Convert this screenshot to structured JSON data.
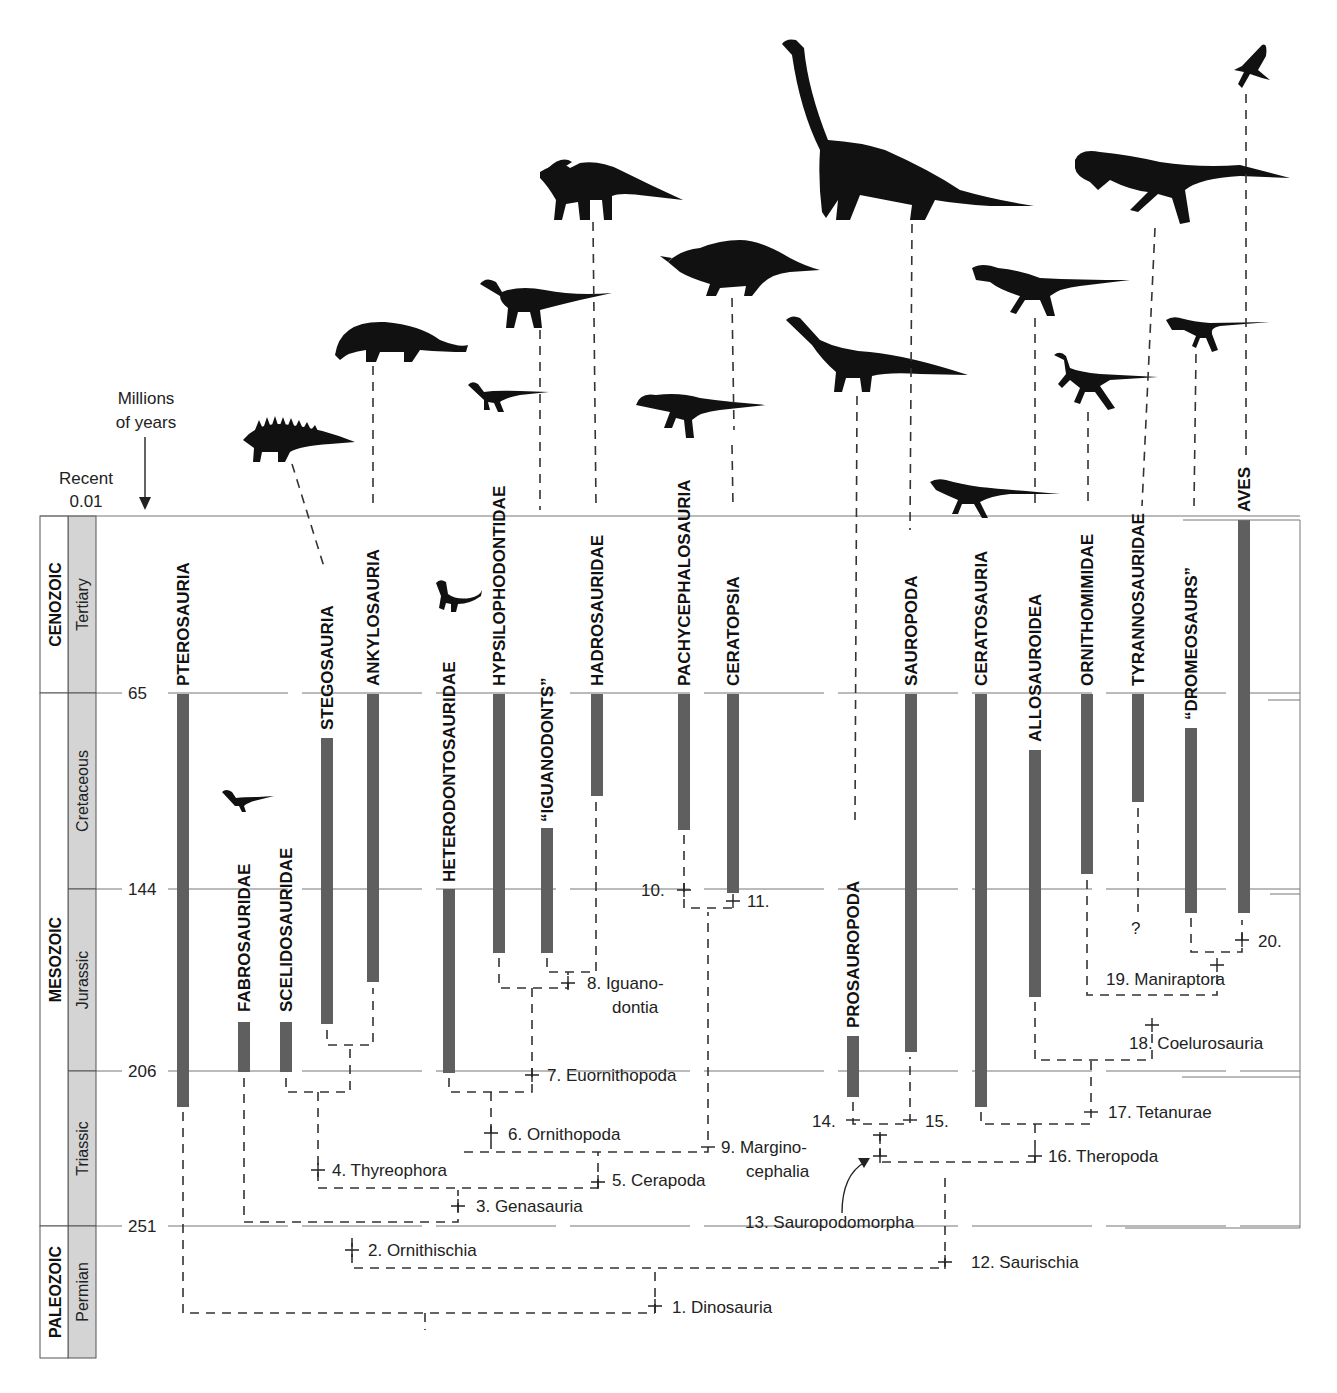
{
  "axis": {
    "title_line1": "Millions",
    "title_line2": "of years",
    "recent_label": "Recent",
    "recent_value": "0.01",
    "ticks": [
      {
        "label": "65",
        "y": 693
      },
      {
        "label": "144",
        "y": 889
      },
      {
        "label": "206",
        "y": 1071
      },
      {
        "label": "251",
        "y": 1226
      }
    ]
  },
  "timescale": {
    "eras": [
      {
        "name": "CENOZOIC",
        "y0": 516,
        "y1": 693
      },
      {
        "name": "MESOZOIC",
        "y0": 693,
        "y1": 1226
      },
      {
        "name": "PALEOZOIC",
        "y0": 1226,
        "y1": 1358
      }
    ],
    "periods": [
      {
        "name": "Tertiary",
        "y0": 516,
        "y1": 693
      },
      {
        "name": "Cretaceous",
        "y0": 693,
        "y1": 889
      },
      {
        "name": "Jurassic",
        "y0": 889,
        "y1": 1071
      },
      {
        "name": "Triassic",
        "y0": 1071,
        "y1": 1226
      },
      {
        "name": "Permian",
        "y0": 1226,
        "y1": 1358
      }
    ]
  },
  "taxa": [
    {
      "name": "PTEROSAURIA",
      "x": 183,
      "label_bottom": 686,
      "bar_top": 694,
      "bar_bottom": 1107
    },
    {
      "name": "FABROSAURIDAE",
      "x": 244,
      "label_bottom": 1012,
      "bar_top": 1022,
      "bar_bottom": 1072
    },
    {
      "name": "SCELIDOSAURIDAE",
      "x": 286,
      "label_bottom": 1012,
      "bar_top": 1022,
      "bar_bottom": 1072
    },
    {
      "name": "STEGOSAURIA",
      "x": 327,
      "label_bottom": 730,
      "bar_top": 738,
      "bar_bottom": 1024
    },
    {
      "name": "ANKYLOSAURIA",
      "x": 373,
      "label_bottom": 686,
      "bar_top": 694,
      "bar_bottom": 982
    },
    {
      "name": "HETERODONTOSAURIDAE",
      "x": 449,
      "label_bottom": 882,
      "bar_top": 889,
      "bar_bottom": 1073
    },
    {
      "name": "HYPSILOPHODONTIDAE",
      "x": 499,
      "label_bottom": 686,
      "bar_top": 694,
      "bar_bottom": 953
    },
    {
      "name": "“IGUANODONTS”",
      "x": 547,
      "label_bottom": 822,
      "bar_top": 828,
      "bar_bottom": 953
    },
    {
      "name": "HADROSAURIDAE",
      "x": 597,
      "label_bottom": 686,
      "bar_top": 694,
      "bar_bottom": 796
    },
    {
      "name": "PACHYCEPHALOSAURIA",
      "x": 684,
      "label_bottom": 686,
      "bar_top": 694,
      "bar_bottom": 830
    },
    {
      "name": "CERATOPSIA",
      "x": 733,
      "label_bottom": 686,
      "bar_top": 694,
      "bar_bottom": 893
    },
    {
      "name": "PROSAUROPODA",
      "x": 853,
      "label_bottom": 1028,
      "bar_top": 1036,
      "bar_bottom": 1097
    },
    {
      "name": "SAUROPODA",
      "x": 911,
      "label_bottom": 686,
      "bar_top": 694,
      "bar_bottom": 1052
    },
    {
      "name": "CERATOSAURIA",
      "x": 981,
      "label_bottom": 686,
      "bar_top": 694,
      "bar_bottom": 1107
    },
    {
      "name": "ALLOSAUROIDEA",
      "x": 1035,
      "label_bottom": 742,
      "bar_top": 750,
      "bar_bottom": 997
    },
    {
      "name": "ORNITHOMIMIDAE",
      "x": 1087,
      "label_bottom": 686,
      "bar_top": 694,
      "bar_bottom": 874
    },
    {
      "name": "TYRANNOSAURIDAE",
      "x": 1138,
      "label_bottom": 686,
      "bar_top": 694,
      "bar_bottom": 802
    },
    {
      "name": "“DROMEOSAURS”",
      "x": 1191,
      "label_bottom": 720,
      "bar_top": 728,
      "bar_bottom": 913
    },
    {
      "name": "AVES",
      "x": 1244,
      "label_bottom": 512,
      "bar_top": 520,
      "bar_bottom": 913
    }
  ],
  "nodes": [
    {
      "label": "1. Dinosauria",
      "x": 672,
      "y": 1313
    },
    {
      "label": "2. Ornithischia",
      "x": 368,
      "y": 1256
    },
    {
      "label": "3. Genasauria",
      "x": 476,
      "y": 1212
    },
    {
      "label": "4. Thyreophora",
      "x": 332,
      "y": 1176
    },
    {
      "label": "5. Cerapoda",
      "x": 612,
      "y": 1186
    },
    {
      "label": "6. Ornithopoda",
      "x": 508,
      "y": 1140
    },
    {
      "label": "7. Euornithopoda",
      "x": 547,
      "y": 1081
    },
    {
      "label": "8. Iguano-",
      "x": 587,
      "y": 989
    },
    {
      "label": "dontia",
      "x": 612,
      "y": 1013
    },
    {
      "label": "9. Margino-",
      "x": 721,
      "y": 1153
    },
    {
      "label": "cephalia",
      "x": 746,
      "y": 1177
    },
    {
      "label": "10.",
      "x": 641,
      "y": 896
    },
    {
      "label": "11.",
      "x": 747,
      "y": 907
    },
    {
      "label": "12. Saurischia",
      "x": 971,
      "y": 1268
    },
    {
      "label": "13. Sauropodomorpha",
      "x": 745,
      "y": 1228
    },
    {
      "label": "14.",
      "x": 812,
      "y": 1127
    },
    {
      "label": "15.",
      "x": 925,
      "y": 1127
    },
    {
      "label": "16. Theropoda",
      "x": 1048,
      "y": 1162
    },
    {
      "label": "17. Tetanurae",
      "x": 1108,
      "y": 1118
    },
    {
      "label": "18. Coelurosauria",
      "x": 1129,
      "y": 1049
    },
    {
      "label": "19. Maniraptora",
      "x": 1106,
      "y": 985
    },
    {
      "label": "20.",
      "x": 1258,
      "y": 947
    },
    {
      "label": "?",
      "x": 1131,
      "y": 934
    }
  ],
  "silhouettes": [
    {
      "taxon": "STEGOSAURIA",
      "name": "stegosaur-silhouette"
    },
    {
      "taxon": "ANKYLOSAURIA",
      "name": "ankylosaur-silhouette"
    },
    {
      "taxon": "HETERODONTOSAURIDAE",
      "name": "heterodontosaur-silhouette"
    },
    {
      "taxon": "HYPSILOPHODONTIDAE",
      "name": "hypsilophodont-silhouette"
    },
    {
      "taxon": "IGUANODONTS",
      "name": "iguanodont-silhouette"
    },
    {
      "taxon": "HADROSAURIDAE",
      "name": "hadrosaur-silhouette"
    },
    {
      "taxon": "PACHYCEPHALOSAURIA",
      "name": "pachycephalosaur-silhouette"
    },
    {
      "taxon": "CERATOPSIA",
      "name": "ceratopsian-silhouette"
    },
    {
      "taxon": "FABROSAURIDAE",
      "name": "fabrosaur-silhouette"
    },
    {
      "taxon": "PROSAUROPODA",
      "name": "prosauropod-silhouette"
    },
    {
      "taxon": "SAUROPODA",
      "name": "sauropod-silhouette"
    },
    {
      "taxon": "CERATOSAURIA",
      "name": "ceratosaur-silhouette"
    },
    {
      "taxon": "ALLOSAUROIDEA",
      "name": "allosaur-silhouette"
    },
    {
      "taxon": "ORNITHOMIMIDAE",
      "name": "ornithomimid-silhouette"
    },
    {
      "taxon": "TYRANNOSAURIDAE",
      "name": "tyrannosaur-silhouette"
    },
    {
      "taxon": "DROMEOSAURS",
      "name": "dromaeosaur-silhouette"
    },
    {
      "taxon": "AVES",
      "name": "bird-silhouette"
    }
  ],
  "colors": {
    "bar": "#5f5f5f",
    "period_fill": "#d4d4d4",
    "line": "#333333"
  }
}
